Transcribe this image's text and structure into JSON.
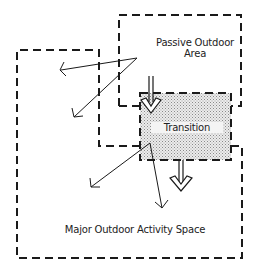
{
  "diagram": {
    "areas": [
      {
        "id": "passive",
        "label_line1": "Passive Outdoor",
        "label_line2": "Area"
      },
      {
        "id": "transition",
        "label": "Transition"
      },
      {
        "id": "major",
        "label": "Major Outdoor Activity Space"
      }
    ],
    "connections": [
      {
        "from": "passive",
        "to": "major",
        "type": "double-arrow",
        "note": "flow into transition"
      },
      {
        "from": "transition",
        "to": "major",
        "type": "double-arrow"
      },
      {
        "from": "passive",
        "to": "major",
        "type": "view-arrows",
        "count": 2
      },
      {
        "from": "transition",
        "to": "major",
        "type": "view-arrows",
        "count": 2
      }
    ],
    "colors": {
      "line": "#1a1a1a",
      "transition_fill": "#d6d6d6",
      "background": "#ffffff"
    }
  }
}
